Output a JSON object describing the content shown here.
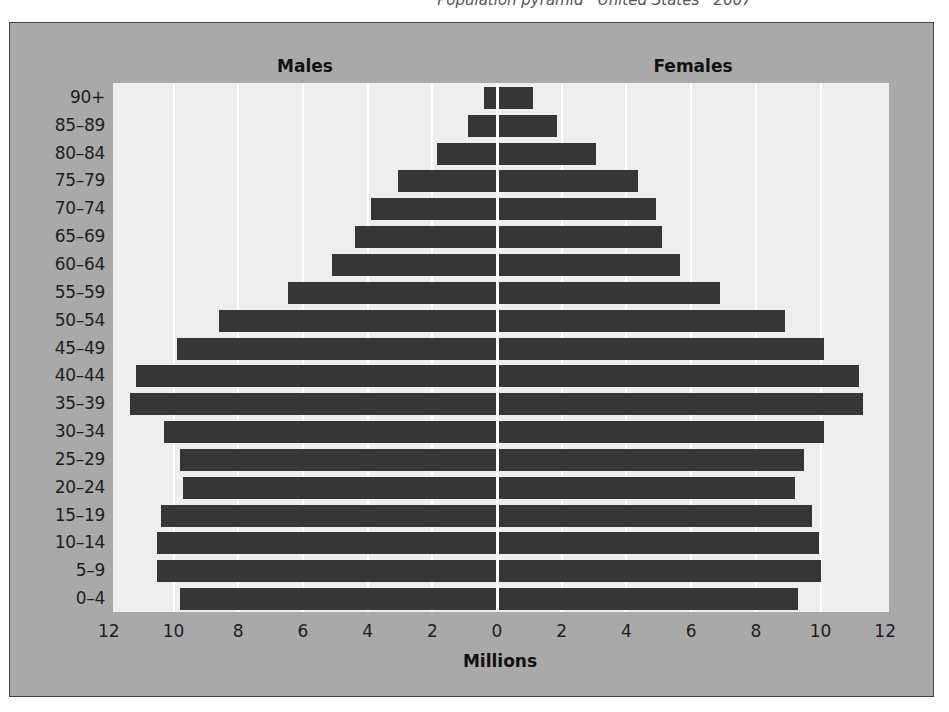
{
  "header": {
    "caption_fragment": "Population pyramid · United States · 2007"
  },
  "chart_data": {
    "type": "bar",
    "orientation": "horizontal",
    "subtype": "population-pyramid",
    "title": "",
    "left_header": "Males",
    "right_header": "Females",
    "xlabel": "Millions",
    "ylabel": "",
    "xlim": [
      -12,
      12
    ],
    "x_ticks": [
      12,
      10,
      8,
      6,
      4,
      2,
      0,
      2,
      4,
      6,
      8,
      10,
      12
    ],
    "grid": true,
    "legend": null,
    "categories": [
      "90+",
      "85–89",
      "80–84",
      "75–79",
      "70–74",
      "65–69",
      "60–64",
      "55–59",
      "50–54",
      "45–49",
      "40–44",
      "35–39",
      "30–34",
      "25–29",
      "20–24",
      "15–19",
      "10–14",
      "5–9",
      "0–4"
    ],
    "series": [
      {
        "name": "Males",
        "side": "left",
        "values": [
          0.4,
          0.9,
          1.85,
          3.05,
          3.9,
          4.4,
          5.1,
          6.45,
          8.6,
          9.9,
          11.15,
          11.35,
          10.3,
          9.8,
          9.7,
          10.4,
          10.5,
          10.5,
          9.8
        ]
      },
      {
        "name": "Females",
        "side": "right",
        "values": [
          1.1,
          1.85,
          3.05,
          4.35,
          4.9,
          5.1,
          5.65,
          6.9,
          8.9,
          10.1,
          11.2,
          11.3,
          10.1,
          9.5,
          9.2,
          9.75,
          9.95,
          10.0,
          9.3
        ]
      }
    ],
    "colors": {
      "bar": "#363636",
      "plot_background": "#eeeeee",
      "frame_background": "#a9a9a9",
      "gridline": "#ffffff"
    }
  }
}
